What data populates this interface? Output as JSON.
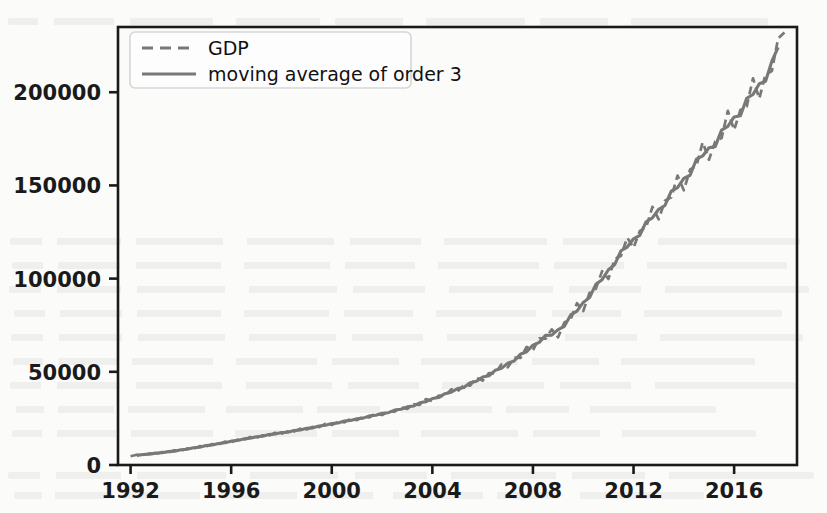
{
  "figure": {
    "background_color": "#fbfbfa",
    "axes_color": "#1a1a1a",
    "line_color": "#787878",
    "legend_border_color": "#d6d6d6"
  },
  "chart_data": {
    "type": "line",
    "title": "",
    "xlabel": "",
    "ylabel": "",
    "xlim": [
      1991.5,
      2018.5
    ],
    "ylim": [
      0,
      235000
    ],
    "grid": false,
    "legend_position": "upper left",
    "xticks": [
      "1992",
      "1996",
      "2000",
      "2004",
      "2008",
      "2012",
      "2016"
    ],
    "xtick_values": [
      1992,
      1996,
      2000,
      2004,
      2008,
      2012,
      2016
    ],
    "yticks": [
      "0",
      "50000",
      "100000",
      "150000",
      "200000"
    ],
    "ytick_values": [
      0,
      50000,
      100000,
      150000,
      200000
    ],
    "x": [
      1992.0,
      1992.25,
      1992.5,
      1992.75,
      1993.0,
      1993.25,
      1993.5,
      1993.75,
      1994.0,
      1994.25,
      1994.5,
      1994.75,
      1995.0,
      1995.25,
      1995.5,
      1995.75,
      1996.0,
      1996.25,
      1996.5,
      1996.75,
      1997.0,
      1997.25,
      1997.5,
      1997.75,
      1998.0,
      1998.25,
      1998.5,
      1998.75,
      1999.0,
      1999.25,
      1999.5,
      1999.75,
      2000.0,
      2000.25,
      2000.5,
      2000.75,
      2001.0,
      2001.25,
      2001.5,
      2001.75,
      2002.0,
      2002.25,
      2002.5,
      2002.75,
      2003.0,
      2003.25,
      2003.5,
      2003.75,
      2004.0,
      2004.25,
      2004.5,
      2004.75,
      2005.0,
      2005.25,
      2005.5,
      2005.75,
      2006.0,
      2006.25,
      2006.5,
      2006.75,
      2007.0,
      2007.25,
      2007.5,
      2007.75,
      2008.0,
      2008.25,
      2008.5,
      2008.75,
      2009.0,
      2009.25,
      2009.5,
      2009.75,
      2010.0,
      2010.25,
      2010.5,
      2010.75,
      2011.0,
      2011.25,
      2011.5,
      2011.75,
      2012.0,
      2012.25,
      2012.5,
      2012.75,
      2013.0,
      2013.25,
      2013.5,
      2013.75,
      2014.0,
      2014.25,
      2014.5,
      2014.75,
      2015.0,
      2015.25,
      2015.5,
      2015.75,
      2016.0,
      2016.25,
      2016.5,
      2016.75,
      2017.0,
      2017.25,
      2017.5,
      2017.75,
      2018.0
    ],
    "series": [
      {
        "name": "GDP",
        "linestyle": "dashed",
        "color": "#787878",
        "values": [
          4700,
          5500,
          5300,
          6200,
          6000,
          6900,
          6700,
          7900,
          7700,
          8900,
          8700,
          10100,
          9900,
          11200,
          11000,
          12500,
          12300,
          13600,
          13400,
          15000,
          14600,
          15900,
          15700,
          17300,
          16800,
          18100,
          17900,
          19500,
          19000,
          20500,
          20300,
          22100,
          21500,
          23100,
          22900,
          24800,
          24100,
          25800,
          25600,
          27700,
          26800,
          28800,
          28600,
          31000,
          30100,
          32500,
          32300,
          35400,
          34300,
          37200,
          37000,
          40600,
          39500,
          42800,
          42600,
          46900,
          45300,
          49300,
          49100,
          54000,
          52400,
          57600,
          57400,
          63300,
          61600,
          68000,
          67800,
          72800,
          68500,
          76500,
          78300,
          86800,
          82600,
          92300,
          94500,
          104000,
          99800,
          110500,
          112300,
          122000,
          116500,
          125600,
          127400,
          138500,
          131800,
          141800,
          143600,
          155300,
          147400,
          158600,
          160400,
          173200,
          163800,
          173600,
          175400,
          190000,
          179700,
          190500,
          192300,
          207500,
          196600,
          209600,
          211400,
          228900,
          232000
        ]
      },
      {
        "name": "moving average of order 3",
        "linestyle": "solid",
        "color": "#787878",
        "values": [
          null,
          5167,
          5667,
          5833,
          6367,
          6533,
          7167,
          7433,
          8167,
          8433,
          9233,
          9567,
          10400,
          10700,
          11567,
          11933,
          12800,
          13100,
          14000,
          14333,
          15167,
          15400,
          16300,
          16600,
          17400,
          17600,
          18500,
          18800,
          19667,
          19933,
          20967,
          21300,
          22233,
          22567,
          23600,
          23933,
          24833,
          25167,
          26367,
          26700,
          27733,
          28067,
          29467,
          29900,
          31200,
          31633,
          33400,
          34000,
          35633,
          36167,
          38267,
          39033,
          40967,
          41633,
          44100,
          44933,
          47167,
          47900,
          50800,
          51833,
          54667,
          55800,
          59433,
          60767,
          64300,
          65800,
          69533,
          69700,
          72600,
          74433,
          80533,
          82567,
          87233,
          89800,
          96933,
          99433,
          104767,
          107533,
          114933,
          116933,
          121367,
          123167,
          130500,
          132567,
          137233,
          139233,
          146900,
          148767,
          153767,
          155467,
          164067,
          165800,
          170200,
          170933,
          179667,
          181700,
          186733,
          187400,
          196767,
          198800,
          204567,
          205867,
          216633,
          224100,
          null
        ]
      }
    ]
  },
  "legend": {
    "entries": [
      {
        "label": "GDP",
        "style": "dashed"
      },
      {
        "label": "moving average of order 3",
        "style": "solid"
      }
    ]
  }
}
